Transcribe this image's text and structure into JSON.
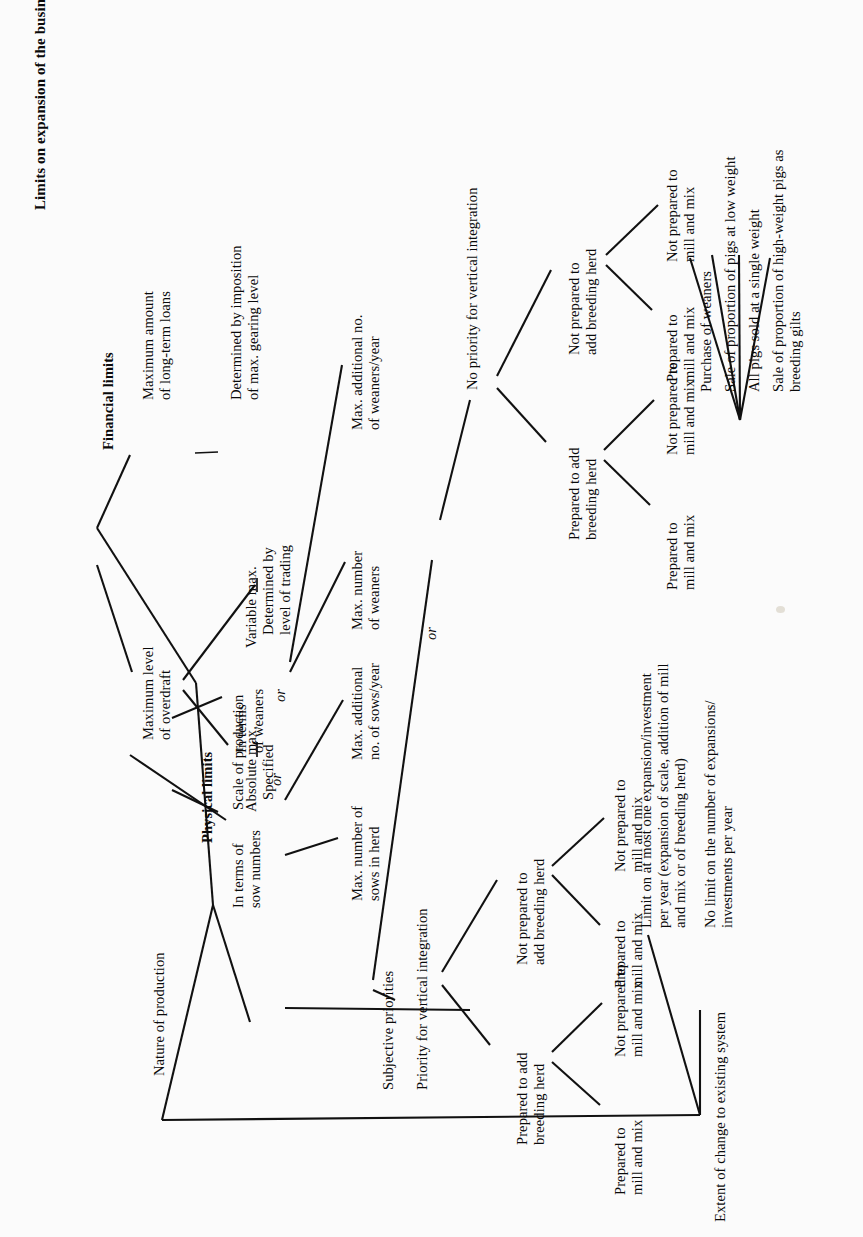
{
  "diagram": {
    "title": "Limits on expansion of the business",
    "orientation": "rotated-90-ccw",
    "nodes": {
      "root": "Limits on expansion of the business",
      "physical_limits": "Physical limits",
      "financial_limits": "Financial limits",
      "nature_of_production": "Nature of production",
      "scale_of_production": "Scale of production",
      "max_long_term_loans": "Maximum amount\nof long-term loans",
      "determined_gearing": "Determined by imposition\nof max. gearing level",
      "max_overdraft": "Maximum level\nof overdraft",
      "absolute_max": "Absolute max.",
      "specified": "Specified",
      "or_overdraft": "or",
      "variable_max": "Variable max.",
      "determined_trading": "Determined by\nlevel of trading",
      "in_terms_sow": "In terms of\nsow numbers",
      "or_scale": "or",
      "in_terms_weaners": "In terms\nof weaners",
      "max_sows_herd": "Max. number of\nsows in herd",
      "max_add_sows": "Max. additional\nno. of sows/year",
      "max_weaners": "Max. number\nof weaners",
      "max_add_weaners": "Max. additional no.\nof weaners/year",
      "purchase_of_weaners": "Purchase of weaners",
      "sale_low_weight": "Sale of proportion of pigs at low weight",
      "all_pigs_single_weight": "All pigs sold at a single weight",
      "sale_high_weight": "Sale of proportion of high-weight pigs as\nbreeding gilts",
      "subjective_priorities": "Subjective priorities",
      "priority_vertical": "Priority for vertical integration",
      "or_subjective": "or",
      "no_priority_vertical": "No priority for vertical integration",
      "p_prep_add_breeding": "Prepared to add\nbreeding herd",
      "p_not_prep_add_breeding": "Not prepared to\nadd breeding herd",
      "p_prep_mill_1": "Prepared to\nmill and mix",
      "p_not_prep_mill_1": "Not prepared to\nmill and mix",
      "p_prep_mill_2": "Prepared to\nmill and mix",
      "p_not_prep_mill_2": "Not prepared to\nmill and mix",
      "np_prep_add_breeding": "Prepared to add\nbreeding herd",
      "np_not_prep_add_breeding": "Not prepared to\nadd breeding herd",
      "np_prep_mill_1": "Prepared to\nmill and mix",
      "np_not_prep_mill_1": "Not prepared to\nmill and mix",
      "np_prep_mill_2": "Prepared to\nmill and mix",
      "np_not_prep_mill_2": "Not prepared to\nmill and mix",
      "extent_of_change": "Extent of change to existing system",
      "limit_one_expansion": "Limit on at most one expansion/investment\nper year (expansion of scale, addition of mill\nand mix or of breeding herd)",
      "no_limit_expansions": "No limit on the number of expansions/\ninvestments per year"
    },
    "edges_count": 34,
    "colors": {
      "ink": "#111111",
      "paper": "#fbfbfb"
    }
  }
}
